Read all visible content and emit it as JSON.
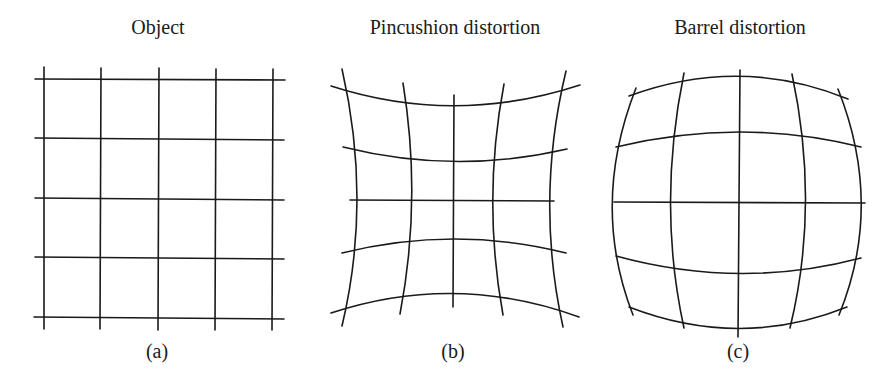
{
  "figure": {
    "panels": [
      {
        "id": "a",
        "title": "Object",
        "caption": "(a)",
        "grid": "undistorted 5x5 rectilinear grid"
      },
      {
        "id": "b",
        "title": "Pincushion distortion",
        "caption": "(b)",
        "grid": "5x5 grid with lines bowing inward toward center"
      },
      {
        "id": "c",
        "title": "Barrel distortion",
        "caption": "(c)",
        "grid": "5x5 grid with lines bowing outward from center"
      }
    ]
  }
}
